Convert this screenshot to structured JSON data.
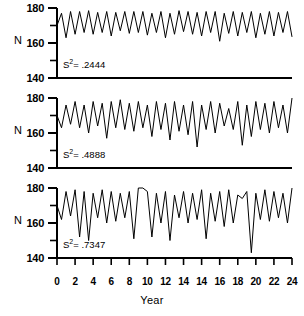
{
  "figure": {
    "axis_title_x": "Year",
    "axis_label_y": "N",
    "y_ticks_major": [
      180,
      160,
      140
    ],
    "y_ticks_minor": [
      170,
      150
    ],
    "x_tick_labels": [
      "0",
      "2",
      "4",
      "6",
      "8",
      "10",
      "12",
      "14",
      "14",
      "16",
      "18",
      "20",
      "22",
      "24"
    ],
    "x_tick_values": [
      0,
      2,
      4,
      6,
      8,
      10,
      12,
      14,
      16,
      18,
      20,
      22,
      24,
      26
    ]
  },
  "panels": [
    {
      "name": "panel-low-variance",
      "annotation_prefix": "S",
      "annotation_sup": "2",
      "annotation_value": "= .2444",
      "variance": 0.2444
    },
    {
      "name": "panel-mid-variance",
      "annotation_prefix": "S",
      "annotation_sup": "2",
      "annotation_value": "= .4888",
      "variance": 0.4888
    },
    {
      "name": "panel-high-variance",
      "annotation_prefix": "S",
      "annotation_sup": "2",
      "annotation_value": "= .7347",
      "variance": 0.7347
    }
  ],
  "chart_data": {
    "type": "line",
    "title": "",
    "xlabel": "Year",
    "ylabel": "N",
    "xlim": [
      0,
      26
    ],
    "ylim": [
      140,
      180
    ],
    "grid": false,
    "legend": "none",
    "subplots": [
      {
        "name": "S2 = .2444",
        "annotation": "S² = .2444",
        "variance": 0.2444,
        "x": [
          0,
          0.5,
          1,
          1.5,
          2,
          2.5,
          3,
          3.5,
          4,
          4.5,
          5,
          5.5,
          6,
          6.5,
          7,
          7.5,
          8,
          8.5,
          9,
          9.5,
          10,
          10.5,
          11,
          11.5,
          12,
          12.5,
          13,
          13.5,
          14,
          14.5,
          15,
          15.5,
          16,
          16.5,
          17,
          17.5,
          18,
          18.5,
          19,
          19.5,
          20,
          20.5,
          21,
          21.5,
          22,
          22.5,
          23,
          23.5,
          24,
          24.5,
          25,
          25.5,
          26
        ],
        "y": [
          170,
          177,
          163,
          178,
          165,
          178,
          166,
          178.5,
          165,
          177.5,
          166,
          178,
          164,
          177.5,
          167,
          178,
          165.5,
          178,
          166,
          178,
          164.5,
          177,
          166,
          178,
          163,
          177,
          165,
          178.5,
          166.5,
          178,
          165,
          177.5,
          164,
          178,
          166,
          178,
          161,
          177,
          165.5,
          178,
          164,
          177.5,
          166,
          178,
          163,
          177,
          165,
          178,
          164,
          177.5,
          166,
          178,
          163.5
        ]
      },
      {
        "name": "S2 = .4888",
        "annotation": "S² = .4888",
        "variance": 0.4888,
        "x": [
          0,
          0.5,
          1,
          1.5,
          2,
          2.5,
          3,
          3.5,
          4,
          4.5,
          5,
          5.5,
          6,
          6.5,
          7,
          7.5,
          8,
          8.5,
          9,
          9.5,
          10,
          10.5,
          11,
          11.5,
          12,
          12.5,
          13,
          13.5,
          14,
          14.5,
          15,
          15.5,
          16,
          16.5,
          17,
          17.5,
          18,
          18.5,
          19,
          19.5,
          20,
          20.5,
          21,
          21.5,
          22,
          22.5,
          23,
          23.5,
          24,
          24.5,
          25,
          25.5,
          26
        ],
        "y": [
          170,
          163,
          176,
          165,
          178,
          163,
          176,
          160,
          178,
          164,
          177,
          157,
          178,
          163,
          179,
          162,
          177,
          161,
          178,
          163,
          176,
          158,
          178,
          162,
          177,
          156,
          178,
          161,
          176,
          159,
          178,
          152,
          176,
          162,
          178,
          160,
          177,
          164,
          174,
          162,
          178,
          153,
          176,
          158,
          178,
          162,
          177,
          160,
          178,
          163,
          176,
          160,
          180
        ]
      },
      {
        "name": "S2 = .7347",
        "annotation": "S² = .7347",
        "variance": 0.7347,
        "x": [
          0,
          0.5,
          1,
          1.5,
          2,
          2.5,
          3,
          3.5,
          4,
          4.5,
          5,
          5.5,
          6,
          6.5,
          7,
          7.5,
          8,
          8.5,
          9,
          9.5,
          10,
          10.5,
          11,
          11.5,
          12,
          12.5,
          13,
          13.5,
          14,
          14.5,
          15,
          15.5,
          16,
          16.5,
          17,
          17.5,
          18,
          18.5,
          19,
          19.5,
          20,
          20.5,
          21,
          21.5,
          22,
          22.5,
          23,
          23.5,
          24,
          24.5,
          25,
          25.5,
          26
        ],
        "y": [
          170,
          162,
          178,
          164,
          179,
          152,
          178,
          150,
          177,
          163,
          179,
          160,
          178,
          161,
          177,
          163,
          178,
          151,
          180,
          180,
          178,
          152,
          177,
          160,
          178,
          150,
          176,
          163,
          178,
          160,
          177,
          162,
          179,
          151,
          177,
          161,
          178,
          158,
          179,
          160,
          176,
          174,
          178,
          143,
          177,
          162,
          179,
          161,
          178,
          163,
          177,
          160,
          180
        ]
      }
    ]
  }
}
